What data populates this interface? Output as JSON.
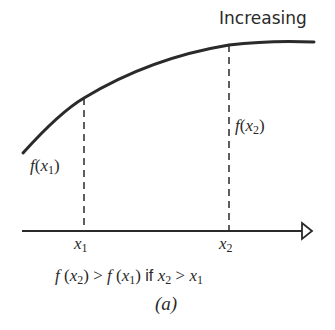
{
  "title": "Increasing",
  "labels": {
    "fx1": {
      "f": "f",
      "open": "(",
      "x": "x",
      "sub": "1",
      "close": ")"
    },
    "fx2": {
      "f": "f",
      "open": "(",
      "x": "x",
      "sub": "2",
      "close": ")"
    },
    "x1": {
      "x": "x",
      "sub": "1"
    },
    "x2": {
      "x": "x",
      "sub": "2"
    }
  },
  "caption": {
    "lhs_f": "f",
    "lhs_open": " (",
    "lhs_x": "x",
    "lhs_sub": "2",
    "lhs_close": ")",
    "gt1": " > ",
    "rhs_f": "f",
    "rhs_open": " (",
    "rhs_x": "x",
    "rhs_sub": "1",
    "rhs_close": ")",
    "if": " if ",
    "c_x2": "x",
    "c_x2_sub": "2",
    "gt2": " > ",
    "c_x1": "x",
    "c_x1_sub": "1"
  },
  "figure_label": "(a)",
  "colors": {
    "ink": "#2a2a2a",
    "background": "#ffffff"
  }
}
